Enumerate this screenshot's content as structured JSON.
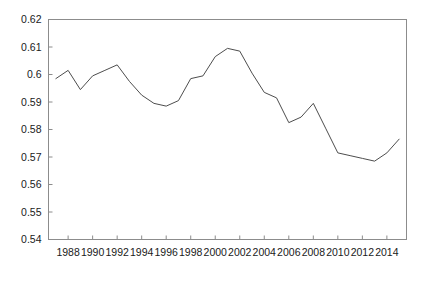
{
  "chart_data": {
    "type": "line",
    "title": "",
    "subtitle": "",
    "xlabel": "",
    "ylabel": "",
    "grid": false,
    "legend": "none",
    "frame": "box",
    "line_color": "#4d4d4d",
    "axis_color": "#8c8c8c",
    "background": "#ffffff",
    "xlim": [
      1986.4,
      1415.6
    ],
    "xlim_years": [
      1986.4,
      2015.6
    ],
    "ylim": [
      0.54,
      0.62
    ],
    "ytick_labels": [
      "0.62",
      "0.61",
      "0.6",
      "0.59",
      "0.58",
      "0.57",
      "0.56",
      "0.55",
      "0.54"
    ],
    "ytick_values": [
      0.62,
      0.61,
      0.6,
      0.59,
      0.58,
      0.57,
      0.56,
      0.55,
      0.54
    ],
    "xtick_labels": [
      "1988",
      "1990",
      "1992",
      "1994",
      "1996",
      "1998",
      "2000",
      "2002",
      "2004",
      "2006",
      "2008",
      "2010",
      "2012",
      "2014"
    ],
    "xtick_values": [
      1988,
      1990,
      1992,
      1994,
      1996,
      1998,
      2000,
      2002,
      2004,
      2006,
      2008,
      2010,
      2012,
      2014
    ],
    "x": [
      1987,
      1988,
      1989,
      1990,
      1991,
      1992,
      1993,
      1994,
      1995,
      1996,
      1997,
      1998,
      1999,
      2000,
      2001,
      2002,
      2003,
      2004,
      2005,
      2006,
      2007,
      2008,
      2009,
      2010,
      2011,
      2012,
      2013,
      2014,
      2015
    ],
    "values": [
      0.5985,
      0.6015,
      0.5945,
      0.5995,
      0.6015,
      0.6035,
      0.5975,
      0.5925,
      0.5895,
      0.5885,
      0.5905,
      0.5985,
      0.5995,
      0.6065,
      0.6095,
      0.6085,
      0.6005,
      0.5935,
      0.5915,
      0.5825,
      0.5845,
      0.5895,
      0.5805,
      0.5715,
      0.5705,
      0.5695,
      0.5685,
      0.5715,
      0.5765
    ],
    "series": [
      {
        "name": "series-1",
        "values": [
          0.5985,
          0.6015,
          0.5945,
          0.5995,
          0.6015,
          0.6035,
          0.5975,
          0.5925,
          0.5895,
          0.5885,
          0.5905,
          0.5985,
          0.5995,
          0.6065,
          0.6095,
          0.6085,
          0.6005,
          0.5935,
          0.5915,
          0.5825,
          0.5845,
          0.5895,
          0.5805,
          0.5715,
          0.5705,
          0.5695,
          0.5685,
          0.5715,
          0.5765
        ]
      }
    ]
  }
}
